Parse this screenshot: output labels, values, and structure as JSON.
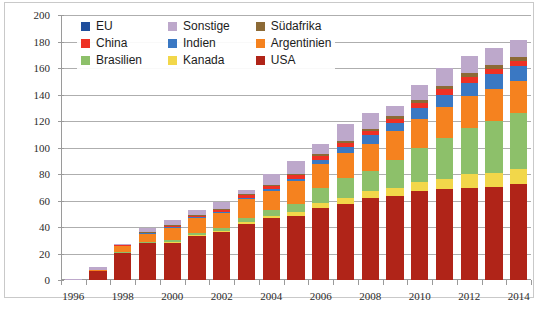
{
  "chart_data": {
    "type": "bar",
    "stacked": true,
    "title": "",
    "xlabel": "",
    "ylabel": "",
    "grid": true,
    "legend_position": "top-inside",
    "ylim": [
      0,
      200
    ],
    "ytick_step": 20,
    "ytick_labels": [
      "0",
      "20",
      "40",
      "60",
      "80",
      "100",
      "120",
      "140",
      "160",
      "180",
      "200"
    ],
    "x": [
      1996,
      1997,
      1998,
      1999,
      2000,
      2001,
      2002,
      2003,
      2004,
      2005,
      2006,
      2007,
      2008,
      2009,
      2010,
      2011,
      2012,
      2013,
      2014
    ],
    "xtick_labels": [
      "1996",
      "",
      "1998",
      "",
      "2000",
      "",
      "2002",
      "",
      "2004",
      "",
      "2006",
      "",
      "2008",
      "",
      "2010",
      "",
      "2012",
      "",
      "2014"
    ],
    "categories": [
      "1996",
      "1997",
      "1998",
      "1999",
      "2000",
      "2001",
      "2002",
      "2003",
      "2004",
      "2005",
      "2006",
      "2007",
      "2008",
      "2009",
      "2010",
      "2011",
      "2012",
      "2013",
      "2014"
    ],
    "series": [
      {
        "name": "USA",
        "color": "#B02418",
        "values": [
          0.4,
          7.3,
          20.9,
          28.1,
          28.5,
          33.4,
          36.0,
          42.6,
          46.5,
          48.5,
          54.4,
          57.7,
          61.6,
          63.3,
          66.8,
          68.4,
          69.5,
          69.9,
          72.6
        ]
      },
      {
        "name": "Kanada",
        "color": "#F2D74A",
        "values": [
          0.1,
          0.2,
          0.3,
          0.4,
          0.5,
          0.6,
          1.0,
          1.5,
          2.0,
          2.5,
          3.5,
          4.5,
          5.5,
          6.5,
          7.5,
          8.0,
          10.5,
          10.8,
          11.0
        ]
      },
      {
        "name": "Brasilien",
        "color": "#8DC06A",
        "values": [
          0.0,
          0.0,
          0.1,
          0.4,
          1.0,
          1.5,
          2.0,
          3.0,
          4.0,
          6.5,
          11.5,
          14.5,
          15.5,
          21.0,
          25.0,
          30.5,
          35.0,
          39.5,
          42.2
        ]
      },
      {
        "name": "Argentinien",
        "color": "#F5821F",
        "values": [
          0.1,
          0.4,
          5.0,
          6.6,
          10.0,
          11.5,
          12.0,
          14.0,
          15.0,
          17.0,
          18.0,
          19.5,
          20.0,
          21.5,
          22.5,
          23.5,
          23.5,
          24.2,
          24.3
        ]
      },
      {
        "name": "Indien",
        "color": "#3A78C3",
        "values": [
          0.0,
          0.0,
          0.1,
          0.2,
          0.3,
          0.4,
          0.6,
          1.0,
          1.3,
          2.0,
          3.5,
          4.5,
          6.5,
          6.0,
          8.0,
          9.5,
          10.5,
          10.8,
          11.6
        ]
      },
      {
        "name": "China",
        "color": "#EE3124",
        "values": [
          0.0,
          0.0,
          0.3,
          0.5,
          0.6,
          0.8,
          1.5,
          2.0,
          2.5,
          3.0,
          3.0,
          3.0,
          3.0,
          3.5,
          3.5,
          4.0,
          4.0,
          4.1,
          3.6
        ]
      },
      {
        "name": "Südafrika",
        "color": "#8C6A36",
        "values": [
          0.0,
          0.0,
          0.2,
          0.3,
          0.4,
          0.5,
          0.5,
          0.6,
          0.7,
          0.8,
          1.4,
          1.5,
          1.8,
          1.8,
          2.2,
          2.3,
          2.9,
          2.9,
          3.0
        ]
      },
      {
        "name": "Sonstige",
        "color": "#BDA8CB",
        "values": [
          0.3,
          2.1,
          0.1,
          2.5,
          3.7,
          4.3,
          5.4,
          3.3,
          8.0,
          9.2,
          7.7,
          12.7,
          12.1,
          7.5,
          11.5,
          13.8,
          13.1,
          12.8,
          12.7
        ]
      },
      {
        "name": "EU",
        "color": "#1F4E9C",
        "values": [
          0.0,
          0.0,
          0.0,
          0.0,
          0.0,
          0.0,
          0.0,
          0.0,
          0.0,
          0.0,
          0.0,
          0.0,
          0.0,
          0.0,
          0.0,
          0.0,
          0.0,
          0.0,
          0.0
        ]
      }
    ],
    "totals": [
      0.9,
      10.0,
      27.0,
      39.0,
      45.0,
      53.0,
      59.0,
      68.0,
      80.0,
      89.5,
      103.0,
      118.0,
      126.0,
      131.0,
      147.0,
      160.0,
      169.0,
      175.0,
      181.0
    ]
  },
  "legend": {
    "items": [
      {
        "label": "EU",
        "color": "#1F4E9C"
      },
      {
        "label": "Sonstige",
        "color": "#BDA8CB"
      },
      {
        "label": "Südafrika",
        "color": "#8C6A36"
      },
      {
        "label": "China",
        "color": "#EE3124"
      },
      {
        "label": "Indien",
        "color": "#3A78C3"
      },
      {
        "label": "Argentinien",
        "color": "#F5821F"
      },
      {
        "label": "Brasilien",
        "color": "#8DC06A"
      },
      {
        "label": "Kanada",
        "color": "#F2D74A"
      },
      {
        "label": "USA",
        "color": "#B02418"
      }
    ]
  },
  "caption": {
    "text": ""
  }
}
